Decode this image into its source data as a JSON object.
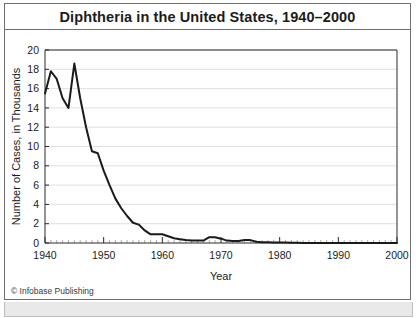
{
  "figure": {
    "title": "Diphtheria in the United States, 1940–2000",
    "credit": "© Infobase Publishing"
  },
  "chart_data": {
    "type": "line",
    "title": "Diphtheria in the United States, 1940–2000",
    "xlabel": "Year",
    "ylabel": "Number of Cases, in Thousands",
    "xlim": [
      1940,
      2000
    ],
    "ylim": [
      0,
      20
    ],
    "ytick_step": 2,
    "yticks": [
      0,
      2,
      4,
      6,
      8,
      10,
      12,
      14,
      16,
      18,
      20
    ],
    "ytick_labels": [
      "0",
      "2",
      "4",
      "6",
      "8",
      "10",
      "12",
      "14",
      "16",
      "18",
      "20"
    ],
    "xticks": [
      1940,
      1950,
      1960,
      1970,
      1980,
      1990,
      2000
    ],
    "xtick_labels": [
      "1940",
      "1950",
      "1960",
      "1970",
      "1980",
      "1990",
      "2000"
    ],
    "x_minor_tick_step": 1,
    "grid": "horizontal",
    "legend": "none",
    "series": [
      {
        "name": "Diphtheria cases",
        "units": "thousands",
        "color": "#1a1a1a",
        "x": [
          1940,
          1941,
          1942,
          1943,
          1944,
          1945,
          1946,
          1947,
          1948,
          1949,
          1950,
          1951,
          1952,
          1953,
          1954,
          1955,
          1956,
          1957,
          1958,
          1959,
          1960,
          1961,
          1962,
          1963,
          1964,
          1965,
          1966,
          1967,
          1968,
          1969,
          1970,
          1971,
          1972,
          1973,
          1974,
          1975,
          1976,
          1977,
          1978,
          1979,
          1980,
          1981,
          1982,
          1983,
          1984,
          1985,
          1986,
          1987,
          1988,
          1989,
          1990,
          1991,
          1992,
          1993,
          1994,
          1995,
          1996,
          1997,
          1998,
          1999,
          2000
        ],
        "values": [
          15.5,
          17.8,
          17.0,
          15.0,
          14.0,
          18.6,
          15.0,
          12.0,
          9.5,
          9.3,
          7.5,
          6.0,
          4.6,
          3.6,
          2.8,
          2.1,
          1.9,
          1.3,
          0.9,
          0.9,
          0.9,
          0.7,
          0.5,
          0.4,
          0.3,
          0.25,
          0.25,
          0.25,
          0.6,
          0.6,
          0.45,
          0.25,
          0.2,
          0.2,
          0.3,
          0.3,
          0.13,
          0.08,
          0.08,
          0.06,
          0.05,
          0.04,
          0.03,
          0.02,
          0.01,
          0.01,
          0.01,
          0.01,
          0.01,
          0.01,
          0.01,
          0.01,
          0.01,
          0.01,
          0.01,
          0.01,
          0.01,
          0.01,
          0.01,
          0.01,
          0.01
        ]
      }
    ]
  }
}
